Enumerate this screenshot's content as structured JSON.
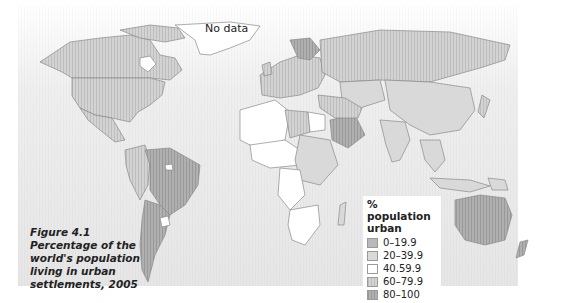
{
  "figure": {
    "number_label": "Figure 4.1",
    "caption_lines": [
      "Percentage of the",
      "world's population",
      "living in urban",
      "settlements, 2005"
    ]
  },
  "map": {
    "no_data_label": "No data",
    "ocean_color": "#e8e8e8"
  },
  "legend": {
    "title_line1": "% population",
    "title_line2": "urban",
    "items": [
      {
        "label": "0–19.9",
        "color": "#b9b9b9"
      },
      {
        "label": "20–39.9",
        "color": "#d9d9d9"
      },
      {
        "label": "40.59.9",
        "color": "#ffffff"
      },
      {
        "label": "60–79.9",
        "color": "#cfcfcf"
      },
      {
        "label": "80–100",
        "color": "#a9a9a9"
      }
    ]
  }
}
